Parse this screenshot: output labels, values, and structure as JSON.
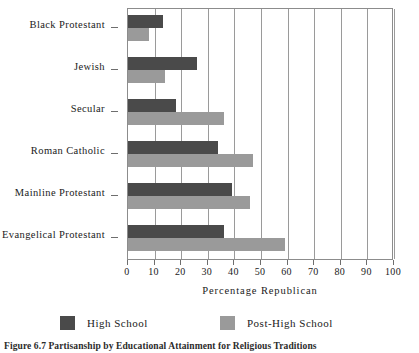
{
  "chart_data": {
    "type": "bar",
    "orientation": "horizontal",
    "title": "",
    "xlabel": "Percentage Republican",
    "ylabel": "",
    "xlim": [
      0,
      100
    ],
    "xticks": [
      0,
      10,
      20,
      30,
      40,
      50,
      60,
      70,
      80,
      90,
      100
    ],
    "grid": true,
    "legend_position": "bottom",
    "categories": [
      "Black Protestant",
      "Jewish",
      "Secular",
      "Roman Catholic",
      "Mainline Protestant",
      "Evangelical Protestant"
    ],
    "series": [
      {
        "name": "High School",
        "color": "#4a4a4a",
        "values": [
          13,
          26,
          18,
          34,
          39,
          36
        ]
      },
      {
        "name": "Post-High School",
        "color": "#9a9a9a",
        "values": [
          8,
          14,
          36,
          47,
          46,
          59
        ]
      }
    ]
  },
  "caption": "Figure 6.7 Partisanship by Educational Attainment for Religious Traditions"
}
